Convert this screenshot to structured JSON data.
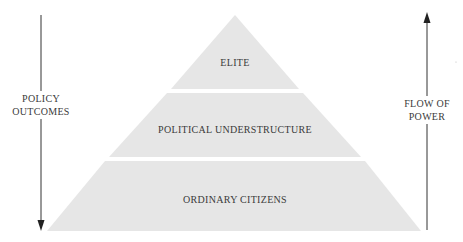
{
  "diagram": {
    "type": "pyramid",
    "colors": {
      "tier_fill": "#e6e6e6",
      "arrow": "#333333",
      "text": "#3a3a3a",
      "background": "#ffffff"
    },
    "tiers": [
      {
        "label": "ELITE"
      },
      {
        "label": "POLITICAL UNDERSTRUCTURE"
      },
      {
        "label": "ORDINARY CITIZENS"
      }
    ],
    "left_arrow": {
      "direction": "down",
      "label_lines": [
        "POLICY",
        "OUTCOMES"
      ]
    },
    "right_arrow": {
      "direction": "up",
      "label_lines": [
        "FLOW OF",
        "POWER"
      ]
    }
  }
}
